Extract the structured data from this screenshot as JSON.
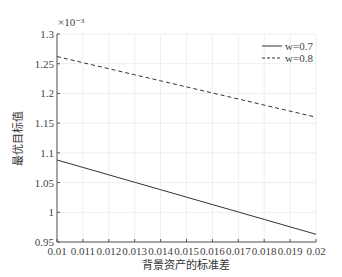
{
  "chart_data": {
    "type": "line",
    "title": "",
    "xlabel": "背景资产的标准差",
    "ylabel": "最优目标值",
    "y_multiplier": "×10⁻³",
    "x": [
      0.01,
      0.011,
      0.012,
      0.013,
      0.014,
      0.015,
      0.016,
      0.017,
      0.018,
      0.019,
      0.02
    ],
    "x_tick_labels": [
      "0.01",
      "0.011",
      "0.012",
      "0.013",
      "0.014",
      "0.015",
      "0.016",
      "0.017",
      "0.018",
      "0.019",
      "0.02"
    ],
    "y_ticks": [
      0.95,
      1.0,
      1.05,
      1.1,
      1.15,
      1.2,
      1.25,
      1.3
    ],
    "y_tick_labels": [
      "0.95",
      "1",
      "1.05",
      "1.1",
      "1.15",
      "1.2",
      "1.25",
      "1.3"
    ],
    "xlim": [
      0.01,
      0.02
    ],
    "ylim": [
      0.95,
      1.3
    ],
    "grid": true,
    "legend_position": "upper right",
    "series": [
      {
        "name": "w=0.7",
        "style": "solid",
        "values": [
          1.088,
          1.0755,
          1.063,
          1.0505,
          1.038,
          1.0255,
          1.013,
          1.0005,
          0.988,
          0.9755,
          0.963
        ]
      },
      {
        "name": "w=0.8",
        "style": "dashed",
        "values": [
          1.262,
          1.2518,
          1.2416,
          1.2314,
          1.2212,
          1.211,
          1.2008,
          1.1906,
          1.1804,
          1.1702,
          1.16
        ]
      }
    ]
  },
  "legend": {
    "items": [
      {
        "label": "w=0.7",
        "style": "solid"
      },
      {
        "label": "w=0.8",
        "style": "dashed"
      }
    ]
  },
  "colors": {
    "line": "#333333",
    "grid": "#eeeeee",
    "axis": "#555555"
  }
}
